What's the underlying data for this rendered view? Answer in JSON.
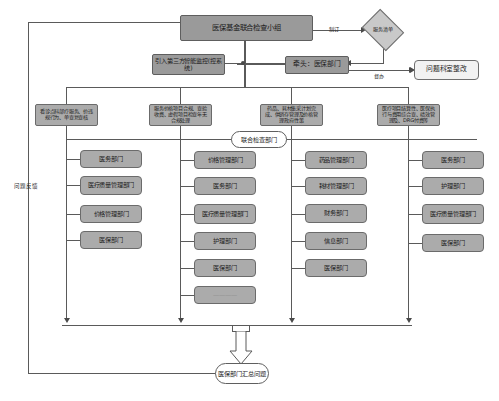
{
  "diagram": {
    "type": "flowchart",
    "top": {
      "root": "医保基金联合检查小组",
      "policy_diamond": "服务清单",
      "edge_to_diamond": "制订",
      "monitoring": "引入第三方智能监控(控系统)",
      "lead": "牵头：医保部门",
      "edge_to_rectify": "督办",
      "rectify": "问题科室整改",
      "feedback_label": "问题反馈"
    },
    "groups": [
      {
        "id": "group-1",
        "scope": "看诊点科部疗服务、价违规行为、单查复查核",
        "departments": [
          "医务部门",
          "医疗质量管理部门",
          "价格管理部门",
          "医保部门"
        ]
      },
      {
        "id": "group-2",
        "scope": "服务价格项目合规、查验收费、虚假项目检查年无合规处理",
        "departments": [
          "价格管理部门",
          "医务部门",
          "医疗质量管理部门",
          "护理部门",
          "医保部门",
          "————"
        ]
      },
      {
        "id": "group-3",
        "scope": "药品、耗材集采计划完成、供销存管理及价格管理政府性策",
        "departments": [
          "药品管理部门",
          "耗材管理部门",
          "财务部门",
          "信息部门",
          "医保部门"
        ]
      },
      {
        "id": "group-4",
        "scope": "医疗项目结算性、医保执行与费用综合查、绩效管理及、DRG付费等",
        "departments": [
          "医务部门",
          "护理部门",
          "医疗质量管理部门",
          "医保部门"
        ]
      }
    ],
    "center_label": "联合检查部门",
    "summary": "医保部门汇总问题"
  },
  "colors": {
    "node_fill": "#a8a8a8",
    "node_border": "#6f6f6f",
    "light_fill": "#c9c9c9",
    "white_fill": "#f2f2f2",
    "line": "#5a5a5a"
  }
}
